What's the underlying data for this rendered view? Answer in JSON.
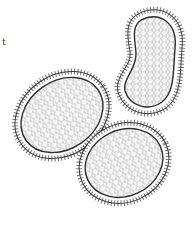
{
  "figure": {
    "label": "t",
    "colors": {
      "background": "#ffffff",
      "ink": "#3a3a3a",
      "stipple": "#6a6a6a"
    },
    "cells": [
      {
        "name": "left-oval-cell",
        "cx": 62,
        "cy": 115,
        "rx": 50,
        "ry": 40,
        "rotate": -35
      },
      {
        "name": "top-right-kidney-cell",
        "cx": 153,
        "cy": 57,
        "rx": 30,
        "ry": 48,
        "rotate": 10
      },
      {
        "name": "bottom-right-oval-cell",
        "cx": 124,
        "cy": 163,
        "rx": 46,
        "ry": 39,
        "rotate": -25
      }
    ]
  }
}
